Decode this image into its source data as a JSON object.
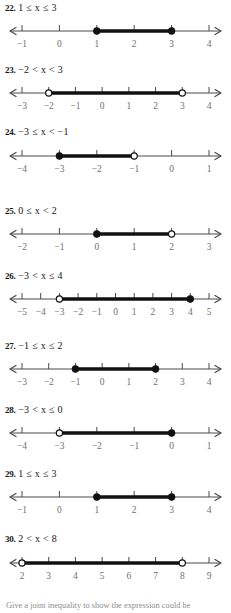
{
  "page": {
    "width": 231,
    "height": 613,
    "background": "#ffffff",
    "ink": "#1a1a1a",
    "tick_label_color": "#6f6f6f",
    "axis_color": "#4a4a4a",
    "segment_color": "#111111"
  },
  "footnote": {
    "text": "Give a joint inequality to show the expression could be"
  },
  "exercises": [
    {
      "id": "ex-22",
      "number": "22.",
      "inequality": "1 ≤ x ≤ 3",
      "top": 2,
      "line_top": 20,
      "ticks": [
        -1,
        0,
        1,
        2,
        3,
        4
      ],
      "tick_labels": [
        "−1",
        "0",
        "1",
        "2",
        "3",
        "4"
      ],
      "domain_min": -1,
      "domain_max": 4,
      "segment": {
        "from": 1,
        "to": 3,
        "left_closed": true,
        "right_closed": true
      },
      "arrow_left": true,
      "arrow_right": true
    },
    {
      "id": "ex-23",
      "number": "23.",
      "inequality": "−2 < x < 3",
      "top": 64,
      "line_top": 82,
      "ticks": [
        -3,
        -2,
        -1,
        0,
        1,
        2,
        3,
        4
      ],
      "tick_labels": [
        "−3",
        "−2",
        "−1",
        "0",
        "1",
        "2",
        "3",
        "4"
      ],
      "domain_min": -3,
      "domain_max": 4,
      "segment": {
        "from": -2,
        "to": 3,
        "left_closed": false,
        "right_closed": false
      },
      "arrow_left": true,
      "arrow_right": true
    },
    {
      "id": "ex-24",
      "number": "24.",
      "inequality": "−3 ≤ x < −1",
      "top": 126,
      "line_top": 145,
      "ticks": [
        -4,
        -3,
        -2,
        -1,
        0,
        1
      ],
      "tick_labels": [
        "−4",
        "−3",
        "−2",
        "−1",
        "0",
        "1"
      ],
      "domain_min": -4,
      "domain_max": 1,
      "segment": {
        "from": -3,
        "to": -1,
        "left_closed": true,
        "right_closed": false
      },
      "arrow_left": true,
      "arrow_right": true
    },
    {
      "id": "ex-25",
      "number": "25.",
      "inequality": "0 ≤ x < 2",
      "top": 205,
      "line_top": 223,
      "ticks": [
        -2,
        -1,
        0,
        1,
        2,
        3
      ],
      "tick_labels": [
        "−2",
        "−1",
        "0",
        "1",
        "2",
        "3"
      ],
      "domain_min": -2,
      "domain_max": 3,
      "segment": {
        "from": 0,
        "to": 2,
        "left_closed": true,
        "right_closed": false
      },
      "arrow_left": true,
      "arrow_right": true
    },
    {
      "id": "ex-26",
      "number": "26.",
      "inequality": "−3 < x ≤ 4",
      "top": 270,
      "line_top": 288,
      "ticks": [
        -5,
        -4,
        -3,
        -2,
        -1,
        0,
        1,
        2,
        3,
        4,
        5
      ],
      "tick_labels": [
        "−5",
        "−4",
        "−3",
        "−2",
        "−1",
        "0",
        "1",
        "2",
        "3",
        "4",
        "5"
      ],
      "domain_min": -5,
      "domain_max": 5,
      "segment": {
        "from": -3,
        "to": 4,
        "left_closed": false,
        "right_closed": true
      },
      "arrow_left": true,
      "arrow_right": true
    },
    {
      "id": "ex-27",
      "number": "27.",
      "inequality": "−1 ≤ x ≤ 2",
      "top": 340,
      "line_top": 358,
      "ticks": [
        -3,
        -2,
        -1,
        0,
        1,
        2,
        3,
        4
      ],
      "tick_labels": [
        "−3",
        "−2",
        "−1",
        "0",
        "1",
        "2",
        "3",
        "4"
      ],
      "domain_min": -3,
      "domain_max": 4,
      "segment": {
        "from": -1,
        "to": 2,
        "left_closed": true,
        "right_closed": true
      },
      "arrow_left": true,
      "arrow_right": true
    },
    {
      "id": "ex-28",
      "number": "28.",
      "inequality": "−3 < x ≤ 0",
      "top": 404,
      "line_top": 422,
      "ticks": [
        -4,
        -3,
        -2,
        -1,
        0,
        1
      ],
      "tick_labels": [
        "−4",
        "−3",
        "−2",
        "−1",
        "0",
        "1"
      ],
      "domain_min": -4,
      "domain_max": 1,
      "segment": {
        "from": -3,
        "to": 0,
        "left_closed": false,
        "right_closed": true
      },
      "arrow_left": true,
      "arrow_right": true
    },
    {
      "id": "ex-29",
      "number": "29.",
      "inequality": "1 ≤ x ≤ 3",
      "top": 468,
      "line_top": 486,
      "ticks": [
        -1,
        0,
        1,
        2,
        3,
        4
      ],
      "tick_labels": [
        "−1",
        "0",
        "1",
        "2",
        "3",
        "4"
      ],
      "domain_min": -1,
      "domain_max": 4,
      "segment": {
        "from": 1,
        "to": 3,
        "left_closed": true,
        "right_closed": true
      },
      "arrow_left": true,
      "arrow_right": true
    },
    {
      "id": "ex-30",
      "number": "30.",
      "inequality": "2 < x < 8",
      "top": 533,
      "line_top": 552,
      "ticks": [
        2,
        3,
        4,
        5,
        6,
        7,
        8,
        9
      ],
      "tick_labels": [
        "2",
        "3",
        "4",
        "5",
        "6",
        "7",
        "8",
        "9"
      ],
      "domain_min": 2,
      "domain_max": 9,
      "segment": {
        "from": 2,
        "to": 8,
        "left_closed": false,
        "right_closed": false
      },
      "arrow_left": true,
      "arrow_right": true
    }
  ]
}
